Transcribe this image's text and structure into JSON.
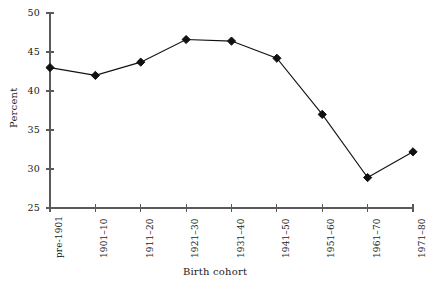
{
  "chart_data": {
    "type": "line",
    "title": "",
    "xlabel": "Birth cohort",
    "ylabel": "Percent",
    "categories": [
      "pre-1901",
      "1901–10",
      "1911–20",
      "1921–30",
      "1931–40",
      "1941–50",
      "1951–60",
      "1961–70",
      "1971–80"
    ],
    "values": [
      43.0,
      42.0,
      43.7,
      46.6,
      46.4,
      44.2,
      37.0,
      28.9,
      32.2
    ],
    "ylim": [
      25,
      50
    ],
    "ytick_labels": [
      "25",
      "30",
      "35",
      "40",
      "45",
      "50"
    ],
    "yticks": [
      25,
      30,
      35,
      40,
      45,
      50
    ],
    "grid": false,
    "legend": "none",
    "series_color": "#111111",
    "axis_color": "#5a5a5a",
    "marker": "diamond"
  },
  "figure": {
    "background": "#ffffff"
  }
}
